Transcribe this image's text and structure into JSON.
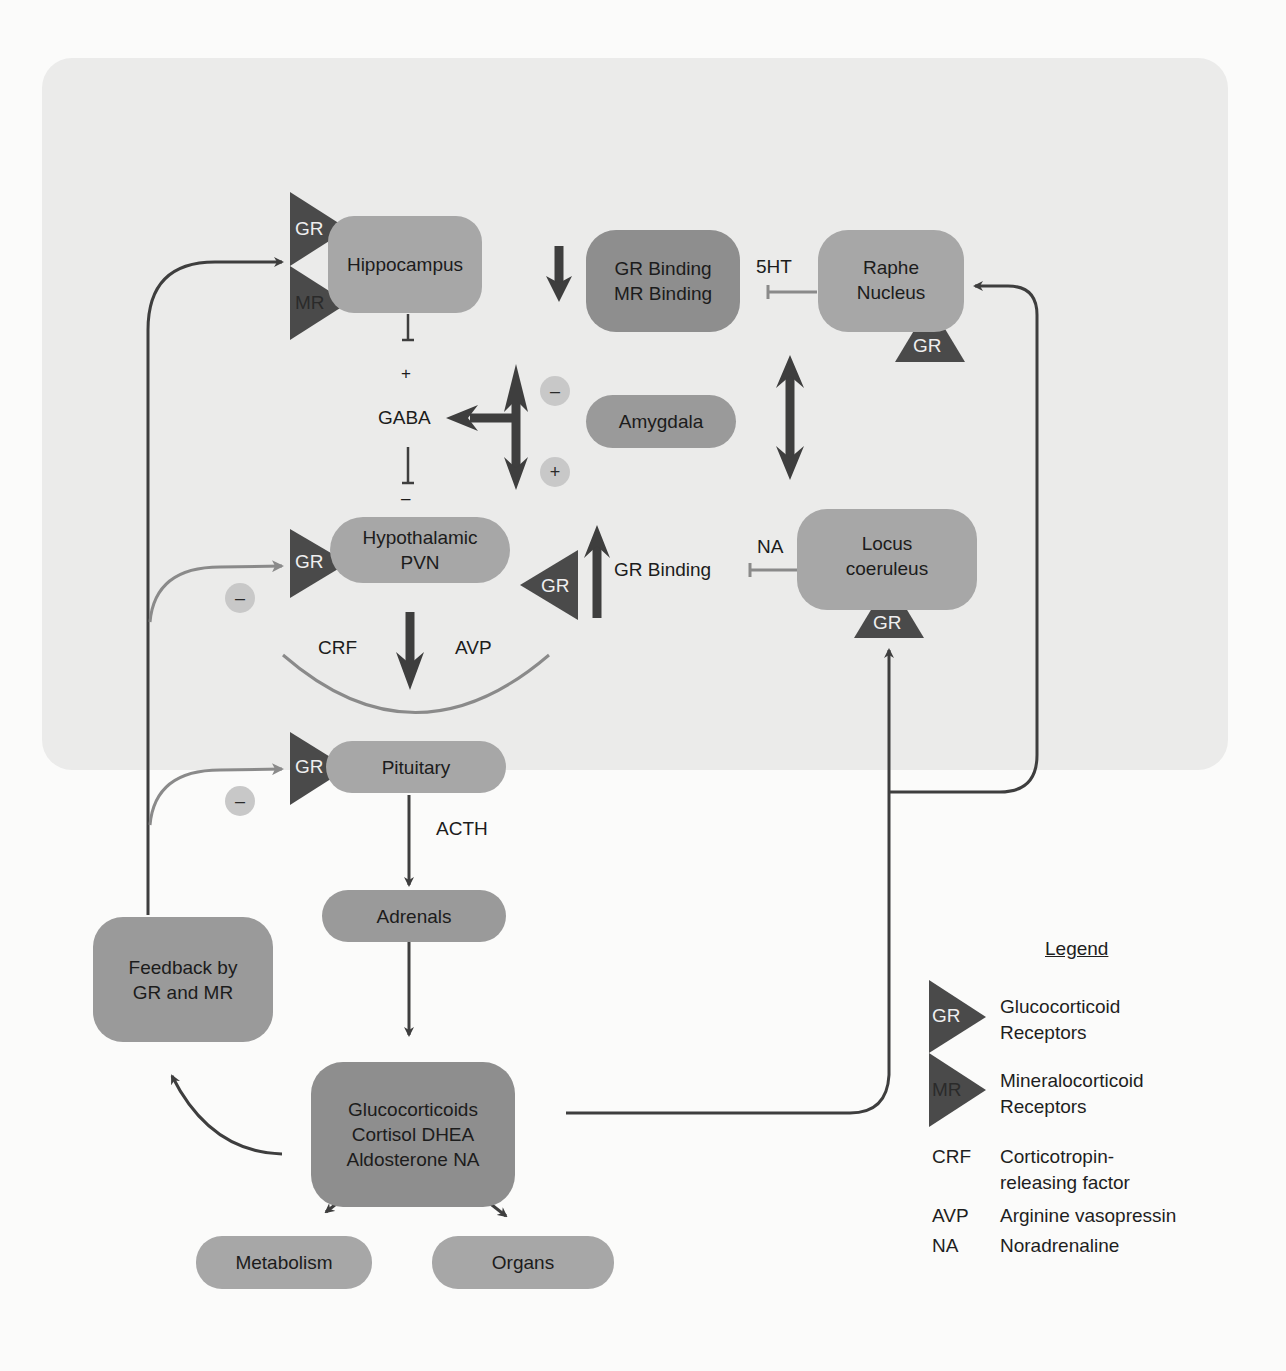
{
  "diagram": {
    "nodes": {
      "hippocampus": "Hippocampus",
      "binding_line1": "GR Binding",
      "binding_line2": "MR Binding",
      "raphe_line1": "Raphe",
      "raphe_line2": "Nucleus",
      "amygdala": "Amygdala",
      "pvn_line1": "Hypothalamic",
      "pvn_line2": "PVN",
      "locus_line1": "Locus",
      "locus_line2": "coeruleus",
      "pituitary": "Pituitary",
      "adrenals": "Adrenals",
      "feedback_line1": "Feedback by",
      "feedback_line2": "GR and MR",
      "gluco_line1": "Glucocorticoids",
      "gluco_line2": "Cortisol DHEA",
      "gluco_line3": "Aldosterone NA",
      "metabolism": "Metabolism",
      "organs": "Organs"
    },
    "labels": {
      "gaba": "GABA",
      "plus_top": "+",
      "minus_mid": "–",
      "five_ht": "5HT",
      "na": "NA",
      "gr_binding": "GR Binding",
      "crf": "CRF",
      "avp": "AVP",
      "acth": "ACTH"
    },
    "receptors": {
      "gr": "GR",
      "mr": "MR"
    },
    "signs": {
      "minus": "–",
      "plus": "+"
    }
  },
  "legend": {
    "title": "Legend",
    "items": [
      {
        "key": "GR",
        "line1": "Glucocorticoid",
        "line2": "Receptors"
      },
      {
        "key": "MR",
        "line1": "Mineralocorticoid",
        "line2": "Receptors"
      },
      {
        "key": "CRF",
        "line1": "Corticotropin-",
        "line2": "releasing factor"
      },
      {
        "key": "AVP",
        "line1": "Arginine vasopressin"
      },
      {
        "key": "NA",
        "line1": "Noradrenaline"
      }
    ]
  },
  "colors": {
    "receptor": "#4a4a4a",
    "node_light": "#a7a7a7",
    "node_dark": "#8e8e8e",
    "arrow_dark": "#3e3e3e",
    "arrow_gray": "#8a8a8a"
  }
}
